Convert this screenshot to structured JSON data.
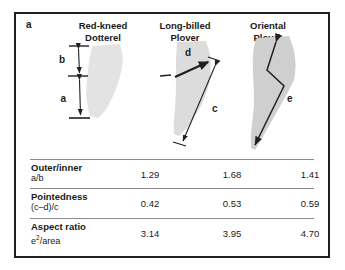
{
  "panel": {
    "label": "a"
  },
  "columns": [
    {
      "id": "red-kneed-dotterel",
      "line1": "Red-kneed",
      "line2": "Dotterel",
      "name": "Red-kneed Dotterel"
    },
    {
      "id": "long-billed-plover",
      "line1": "Long-billed",
      "line2": "Plover",
      "name": "Long-billed Plover"
    },
    {
      "id": "oriental-plover",
      "line1": "Oriental",
      "line2": "Plover",
      "name": "Oriental Plover"
    }
  ],
  "measurements": {
    "b": "b",
    "a": "a",
    "d": "d",
    "c": "c",
    "e": "e"
  },
  "table": {
    "rows": [
      {
        "metric": "Outer/inner",
        "formula": "a/b",
        "formula_sup": "",
        "values": [
          "1.29",
          "1.68",
          "1.41"
        ]
      },
      {
        "metric": "Pointedness",
        "formula": "(c–d)/c",
        "formula_sup": "",
        "values": [
          "0.42",
          "0.53",
          "0.59"
        ]
      },
      {
        "metric": "Aspect ratio",
        "formula_pre": "e",
        "formula_sup": "2",
        "formula_post": "/area",
        "formula": "e2/area",
        "values": [
          "3.14",
          "3.95",
          "4.70"
        ]
      }
    ]
  },
  "colors": {
    "border": "#231f20",
    "wing_light": "#e3e3e3",
    "wing_mid": "#dcdcdc",
    "wing_dark": "#cfcfcf",
    "line": "#231f20",
    "rule": "#8c8c8c",
    "text": "#1a1a1a"
  }
}
